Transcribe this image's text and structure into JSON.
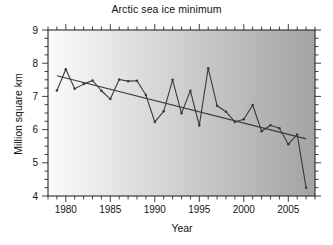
{
  "chart_data": {
    "type": "line",
    "title": "Arctic sea ice minimum",
    "xlabel": "Year",
    "ylabel": "Million square km",
    "xlim": [
      1978,
      2008
    ],
    "ylim": [
      4,
      9
    ],
    "xticks": [
      1980,
      1985,
      1990,
      1995,
      2000,
      2005
    ],
    "xtick_labels": [
      "1980",
      "1985",
      "1990",
      "1995",
      "2000",
      "2005"
    ],
    "yticks": [
      4,
      5,
      6,
      7,
      8,
      9
    ],
    "ytick_labels": [
      "4",
      "5",
      "6",
      "7",
      "8",
      "9"
    ],
    "minor_tick_interval_x": 1,
    "minor_tick_interval_y": 0.25,
    "grid": false,
    "legend": null,
    "x": [
      1979,
      1980,
      1981,
      1982,
      1983,
      1984,
      1985,
      1986,
      1987,
      1988,
      1989,
      1990,
      1991,
      1992,
      1993,
      1994,
      1995,
      1996,
      1997,
      1998,
      1999,
      2000,
      2001,
      2002,
      2003,
      2004,
      2005,
      2006,
      2007
    ],
    "series": [
      {
        "name": "Arctic sea ice minimum extent",
        "style": "line-with-markers",
        "color": "#3a3a3a",
        "values": [
          7.18,
          7.82,
          7.23,
          7.37,
          7.48,
          7.17,
          6.92,
          7.51,
          7.46,
          7.47,
          7.04,
          6.23,
          6.55,
          7.5,
          6.49,
          7.17,
          6.12,
          7.85,
          6.72,
          6.54,
          6.23,
          6.31,
          6.74,
          5.95,
          6.13,
          6.04,
          5.56,
          5.85,
          4.25
        ]
      },
      {
        "name": "Linear trend",
        "style": "straight-line",
        "color": "#3a3a3a",
        "endpoints": [
          [
            1979,
            7.62
          ],
          [
            2007,
            5.72
          ]
        ]
      }
    ],
    "background": {
      "type": "horizontal-gradient",
      "from": "#fbfbfb",
      "to": "#a3a3a3"
    }
  }
}
